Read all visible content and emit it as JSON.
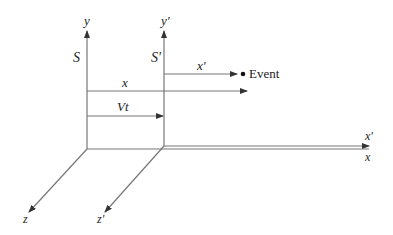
{
  "diagram": {
    "frame_s": {
      "label": "S",
      "y_axis": "y",
      "z_axis": "z",
      "x_axis": "x"
    },
    "frame_s_prime": {
      "label": "S′",
      "y_axis": "y′",
      "z_axis": "z′",
      "x_axis": "x′"
    },
    "measurements": {
      "x_distance": "x",
      "x_prime_distance": "x′",
      "frame_offset": "Vt"
    },
    "event_label": "Event",
    "colors": {
      "line": "#777777",
      "text": "#222222",
      "background": "#ffffff"
    }
  }
}
